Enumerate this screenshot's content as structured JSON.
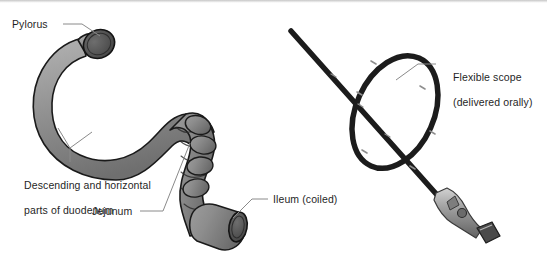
{
  "figure": {
    "background_color": "#ffffff",
    "text_color": "#1f1f1f",
    "leader_line_color": "#8a8a8a",
    "bowel_fill_color": "#8f8f8f",
    "bowel_outline_color": "#1a1a1a",
    "bowel_cut_face_color": "#5a5a5a",
    "scope_color": "#1c1c1c",
    "scope_handle_color": "#9a9a9a",
    "top_rule_color": "#c9c9c9"
  },
  "labels": {
    "pylorus": "Pylorus",
    "duodenum_line1": "Descending and horizontal",
    "duodenum_line2": "parts of duodenum",
    "jejunum": "Jejunum",
    "ileum": "Ileum (coiled)",
    "scope_line1": "Flexible scope",
    "scope_line2": "(delivered orally)"
  },
  "structures": [
    {
      "name": "pylorus",
      "side": "left"
    },
    {
      "name": "descending-and-horizontal-duodenum",
      "side": "left"
    },
    {
      "name": "jejunum",
      "side": "left"
    },
    {
      "name": "ileum",
      "side": "left"
    },
    {
      "name": "flexible-scope",
      "side": "right"
    }
  ]
}
